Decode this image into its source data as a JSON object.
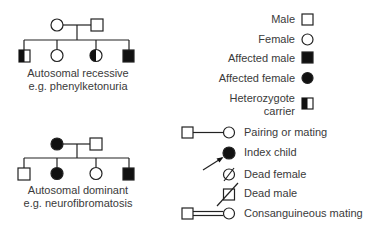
{
  "pedigrees": {
    "recessive": {
      "caption_line1": "Autosomal recessive",
      "caption_line2": "e.g. phenylketonuria",
      "parents": [
        "female",
        "male"
      ],
      "children": [
        "carrier-male",
        "female",
        "carrier-female",
        "affected-male"
      ]
    },
    "dominant": {
      "caption_line1": "Autosomal dominant",
      "caption_line2": "e.g. neurofibromatosis",
      "parents": [
        "affected-female",
        "male"
      ],
      "children": [
        "male",
        "affected-female",
        "female",
        "affected-male"
      ]
    }
  },
  "legend": {
    "male": "Male",
    "female": "Female",
    "affected_male": "Affected male",
    "affected_female": "Affected female",
    "carrier_line1": "Heterozygote",
    "carrier_line2": "carrier",
    "pairing": "Pairing or mating",
    "index_child": "Index child",
    "dead_female": "Dead female",
    "dead_male": "Dead male",
    "consanguineous": "Consanguineous mating"
  },
  "colors": {
    "stroke": "#222222",
    "fill": "#111111",
    "text": "#3a3a3a"
  }
}
